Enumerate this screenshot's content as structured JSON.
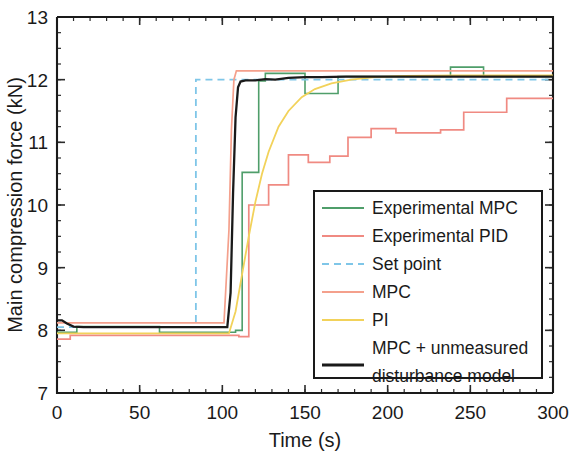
{
  "chart_data": {
    "type": "line",
    "title": "",
    "xlabel": "Time (s)",
    "ylabel": "Main compression force (kN)",
    "xlim": [
      0,
      300
    ],
    "ylim": [
      7,
      13
    ],
    "xticks": [
      0,
      50,
      100,
      150,
      200,
      250,
      300
    ],
    "xtick_labels": [
      "0",
      "50",
      "100",
      "150",
      "200",
      "250",
      "300"
    ],
    "yticks": [
      7,
      8,
      9,
      10,
      11,
      12,
      13
    ],
    "ytick_labels": [
      "7",
      "8",
      "9",
      "10",
      "11",
      "12",
      "13"
    ],
    "x_minor_step": 10,
    "y_minor_step": 0.25,
    "grid": false,
    "legend_position": "lower-right",
    "series": [
      {
        "name": "Experimental MPC",
        "color": "#4f9e6a",
        "style": "solid",
        "width": 1.6,
        "points": [
          [
            0,
            7.97
          ],
          [
            12,
            7.97
          ],
          [
            12,
            8.06
          ],
          [
            62,
            8.06
          ],
          [
            62,
            7.97
          ],
          [
            93,
            7.97
          ],
          [
            108,
            7.97
          ],
          [
            108,
            8.0
          ],
          [
            112,
            8.0
          ],
          [
            112,
            10.52
          ],
          [
            122,
            10.52
          ],
          [
            122,
            11.98
          ],
          [
            126,
            11.98
          ],
          [
            126,
            12.1
          ],
          [
            150,
            12.1
          ],
          [
            150,
            11.78
          ],
          [
            170,
            11.78
          ],
          [
            170,
            12.05
          ],
          [
            238,
            12.05
          ],
          [
            238,
            12.2
          ],
          [
            258,
            12.2
          ],
          [
            258,
            12.05
          ],
          [
            300,
            12.05
          ]
        ]
      },
      {
        "name": "Experimental PID",
        "color": "#f08a82",
        "style": "solid",
        "width": 1.7,
        "points": [
          [
            0,
            7.86
          ],
          [
            8,
            7.86
          ],
          [
            8,
            7.92
          ],
          [
            105,
            7.92
          ],
          [
            110,
            7.92
          ],
          [
            110,
            7.9
          ],
          [
            116,
            7.9
          ],
          [
            116,
            10.0
          ],
          [
            128,
            10.0
          ],
          [
            128,
            10.32
          ],
          [
            140,
            10.32
          ],
          [
            140,
            10.8
          ],
          [
            152,
            10.8
          ],
          [
            152,
            10.68
          ],
          [
            165,
            10.68
          ],
          [
            165,
            10.78
          ],
          [
            176,
            10.78
          ],
          [
            176,
            11.08
          ],
          [
            190,
            11.08
          ],
          [
            190,
            11.22
          ],
          [
            205,
            11.22
          ],
          [
            205,
            11.15
          ],
          [
            232,
            11.15
          ],
          [
            232,
            11.2
          ],
          [
            246,
            11.2
          ],
          [
            246,
            11.48
          ],
          [
            272,
            11.48
          ],
          [
            272,
            11.7
          ],
          [
            300,
            11.7
          ]
        ]
      },
      {
        "name": "Set point",
        "color": "#7fc6e8",
        "style": "dashed",
        "width": 1.8,
        "points": [
          [
            0,
            8.05
          ],
          [
            84,
            8.05
          ],
          [
            84,
            12.0
          ],
          [
            300,
            12.0
          ]
        ]
      },
      {
        "name": "MPC",
        "color": "#f4a08c",
        "style": "solid",
        "width": 1.7,
        "points": [
          [
            0,
            8.12
          ],
          [
            100,
            8.12
          ],
          [
            101,
            8.12
          ],
          [
            104,
            9.6
          ],
          [
            105.5,
            11.2
          ],
          [
            107,
            12.0
          ],
          [
            108.5,
            12.14
          ],
          [
            112,
            12.14
          ],
          [
            300,
            12.14
          ]
        ]
      },
      {
        "name": "PI",
        "color": "#f2d25a",
        "style": "solid",
        "width": 1.8,
        "points": [
          [
            0,
            7.95
          ],
          [
            104,
            7.95
          ],
          [
            108,
            8.3
          ],
          [
            112,
            8.9
          ],
          [
            116,
            9.5
          ],
          [
            120,
            10.05
          ],
          [
            124,
            10.5
          ],
          [
            128,
            10.85
          ],
          [
            134,
            11.25
          ],
          [
            140,
            11.5
          ],
          [
            148,
            11.72
          ],
          [
            156,
            11.85
          ],
          [
            166,
            11.94
          ],
          [
            178,
            12.0
          ],
          [
            192,
            12.04
          ],
          [
            210,
            12.06
          ],
          [
            240,
            12.07
          ],
          [
            300,
            12.07
          ]
        ]
      },
      {
        "name": "MPC + unmeasured disturbance model",
        "color": "#1a1a1a",
        "style": "solid",
        "width": 2.3,
        "points": [
          [
            0,
            8.16
          ],
          [
            3,
            8.16
          ],
          [
            6,
            8.11
          ],
          [
            10,
            8.06
          ],
          [
            16,
            8.05
          ],
          [
            30,
            8.05
          ],
          [
            60,
            8.05
          ],
          [
            90,
            8.05
          ],
          [
            103,
            8.05
          ],
          [
            105,
            8.6
          ],
          [
            106.5,
            10.2
          ],
          [
            108,
            11.4
          ],
          [
            109.5,
            11.88
          ],
          [
            111,
            11.97
          ],
          [
            114,
            11.99
          ],
          [
            120,
            11.99
          ],
          [
            126,
            12.01
          ],
          [
            132,
            12.0
          ],
          [
            140,
            12.03
          ],
          [
            150,
            12.04
          ],
          [
            160,
            12.04
          ],
          [
            175,
            12.05
          ],
          [
            200,
            12.05
          ],
          [
            240,
            12.05
          ],
          [
            300,
            12.05
          ]
        ]
      }
    ]
  },
  "legend": {
    "entries": [
      {
        "label": "Experimental MPC",
        "color": "#4f9e6a",
        "style": "solid"
      },
      {
        "label": "Experimental PID",
        "color": "#f08a82",
        "style": "solid"
      },
      {
        "label": "Set point",
        "color": "#7fc6e8",
        "style": "dashed"
      },
      {
        "label": "MPC",
        "color": "#f4a08c",
        "style": "solid"
      },
      {
        "label": "PI",
        "color": "#f2d25a",
        "style": "solid"
      },
      {
        "label": "MPC + unmeasured",
        "label2": "disturbance model",
        "color": "#1a1a1a",
        "style": "solid"
      }
    ]
  }
}
